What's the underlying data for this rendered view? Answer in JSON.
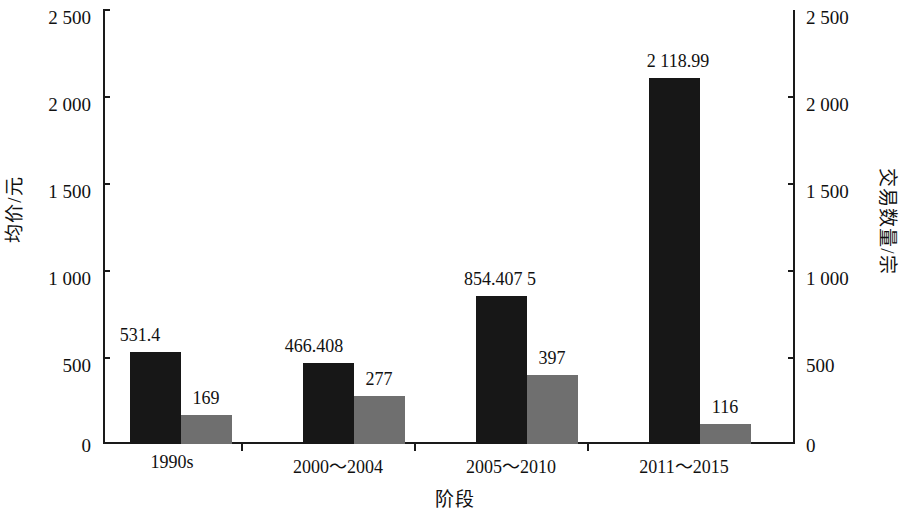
{
  "chart_data": {
    "type": "bar",
    "title": "",
    "subtitle": "",
    "xlabel": "阶段",
    "ylabel": "均价/元",
    "y2label": "交易数量/宗",
    "categories": [
      "1990s",
      "2000～2004",
      "2005～2010",
      "2011～2015"
    ],
    "ylim": [
      0,
      2500
    ],
    "y2lim": [
      0,
      2500
    ],
    "yticks": [
      "0",
      "500",
      "1 000",
      "1 500",
      "2 000",
      "2 500"
    ],
    "ytick_values": [
      0,
      500,
      1000,
      1500,
      2000,
      2500
    ],
    "y2ticks": [
      "0",
      "500",
      "1 000",
      "1 500",
      "2 000",
      "2 500"
    ],
    "grid": false,
    "legend": "none",
    "series": [
      {
        "name": "均价/元",
        "axis": "left",
        "color": "#171717",
        "values": [
          531.4,
          466.408,
          854.4075,
          2118.99
        ],
        "labels": [
          "531.4",
          "466.408",
          "854.407 5",
          "2 118.99"
        ]
      },
      {
        "name": "交易数量/宗",
        "axis": "right",
        "color": "#6f6f6f",
        "values": [
          169,
          277,
          397,
          116
        ],
        "labels": [
          "169",
          "277",
          "397",
          "116"
        ]
      }
    ]
  },
  "colors": {
    "series_price": "#171717",
    "series_count": "#6f6f6f",
    "axis": "#1a1a1a",
    "background": "#ffffff"
  }
}
